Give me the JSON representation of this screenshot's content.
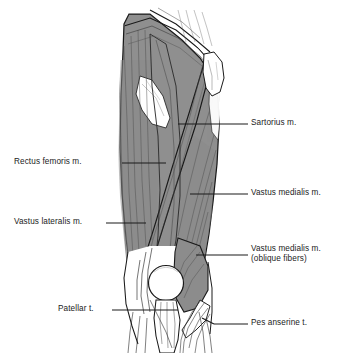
{
  "figure": {
    "colors": {
      "muscle_fill": "#8f8f8f",
      "muscle_fill_dark": "#7e7e7e",
      "tendon_fill": "#ffffff",
      "outline": "#1a1a1a",
      "fiber_line": "#3a3a3a",
      "leader_line": "#1a1a1a",
      "text": "#1b1b1b",
      "background": "#ffffff"
    }
  },
  "labels": {
    "sartorius": {
      "text": "Sartorius m.",
      "side": "right",
      "x": 251,
      "y": 118
    },
    "rectus_femoris": {
      "text": "Rectus femoris m.",
      "side": "left",
      "x": 14,
      "y": 156
    },
    "vastus_medialis": {
      "text": "Vastus medialis m.",
      "side": "right",
      "x": 251,
      "y": 188
    },
    "vastus_lateralis": {
      "text": "Vastus lateralis m.",
      "side": "left",
      "x": 14,
      "y": 216
    },
    "vastus_medialis_oblique": {
      "line1": "Vastus medialis m.",
      "line2": "(oblique fibers)",
      "side": "right",
      "x": 251,
      "y": 244
    },
    "patellar_tendon": {
      "text": "Patellar t.",
      "side": "left",
      "x": 58,
      "y": 303
    },
    "pes_anserine": {
      "text": "Pes anserine t.",
      "side": "right",
      "x": 251,
      "y": 317
    }
  },
  "structures": [
    {
      "name": "sartorius-muscle",
      "kind": "muscle"
    },
    {
      "name": "rectus-femoris-muscle",
      "kind": "muscle"
    },
    {
      "name": "vastus-medialis-muscle",
      "kind": "muscle"
    },
    {
      "name": "vastus-lateralis-muscle",
      "kind": "muscle"
    },
    {
      "name": "vastus-medialis-oblique-fibers",
      "kind": "muscle"
    },
    {
      "name": "patella-bone",
      "kind": "bone"
    },
    {
      "name": "patellar-tendon",
      "kind": "tendon"
    },
    {
      "name": "pes-anserine-tendon",
      "kind": "tendon"
    },
    {
      "name": "anterior-superior-iliac-spine",
      "kind": "bone"
    },
    {
      "name": "tensor-fascia-lata-aponeurosis",
      "kind": "aponeurosis"
    }
  ]
}
